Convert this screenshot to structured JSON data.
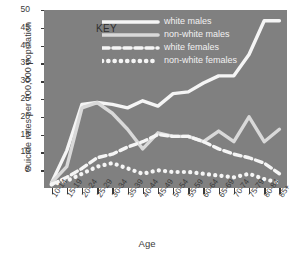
{
  "chart_data": {
    "type": "line",
    "title": "",
    "xlabel": "Age",
    "ylabel": "Suicide rates per 100,000 population",
    "ylim": [
      0,
      50
    ],
    "yticks": [
      5,
      10,
      15,
      20,
      25,
      30,
      35,
      40,
      45,
      50
    ],
    "grid": false,
    "legend_position": "top-left",
    "legend_title": "KEY",
    "categories": [
      "10-14",
      "15-19",
      "20-24",
      "25-29",
      "30-34",
      "35-39",
      "40-44",
      "45-49",
      "50-54",
      "55-59",
      "60-64",
      "65-69",
      "70-74",
      "75-79",
      "80-84",
      "85+"
    ],
    "series": [
      {
        "name": "white males",
        "style": "solid",
        "color": "#f5f5f5",
        "values": [
          1.5,
          10.5,
          23.5,
          24.0,
          23.5,
          22.5,
          24.5,
          23.0,
          26.5,
          27.0,
          29.5,
          31.5,
          31.5,
          37.5,
          47.0,
          47.0
        ]
      },
      {
        "name": "non-white males",
        "style": "solid",
        "color": "#d9d9d9",
        "values": [
          1.5,
          6.0,
          22.5,
          24.0,
          21.0,
          16.5,
          11.0,
          15.5,
          14.5,
          14.5,
          13.0,
          16.0,
          13.0,
          20.0,
          13.0,
          16.5
        ]
      },
      {
        "name": "white females",
        "style": "dashed",
        "color": "#f5f5f5",
        "values": [
          1.0,
          3.0,
          5.5,
          8.5,
          9.5,
          11.5,
          13.0,
          15.0,
          14.5,
          14.5,
          13.0,
          11.0,
          9.5,
          8.5,
          7.0,
          4.0
        ]
      },
      {
        "name": "non-white females",
        "style": "dotted",
        "color": "#f5f5f5",
        "values": [
          1.0,
          2.0,
          4.0,
          6.0,
          7.0,
          5.5,
          4.0,
          5.0,
          4.5,
          4.5,
          4.0,
          3.5,
          3.0,
          4.0,
          2.5,
          1.5
        ]
      }
    ]
  },
  "figure": {
    "caption": ""
  }
}
